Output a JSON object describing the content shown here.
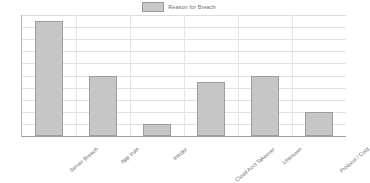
{
  "legend": {
    "entries": [
      {
        "label": "Reason for Breach",
        "swatch_color": "#c6c6c6"
      }
    ],
    "position": "top-center"
  },
  "axes": {
    "y_ticks": [
      "0",
      "2",
      "4",
      "6",
      "8",
      "10",
      "12",
      "14",
      "16",
      "18",
      "20"
    ],
    "x_labels": [
      "Server Breach",
      "App Vuln",
      "Insider",
      "Cloud Acct Takeover",
      "Unknown",
      "Protocol / Cold"
    ]
  },
  "colors": {
    "bar_fill": "#c6c6c6",
    "bar_stroke": "#9d9d9d",
    "grid": "#e2e2e2",
    "axis": "#9e9e9e",
    "text": "#6b6b6b",
    "background": "#ffffff"
  },
  "chart_data": {
    "type": "bar",
    "title": "",
    "subtitle": "",
    "xlabel": "",
    "ylabel": "",
    "categories": [
      "Server Breach",
      "App Vuln",
      "Insider",
      "Cloud Acct Takeover",
      "Unknown",
      "Protocol / Cold"
    ],
    "series": [
      {
        "name": "Reason for Breach",
        "values": [
          19,
          10,
          2,
          9,
          10,
          4
        ],
        "color": "#c6c6c6"
      }
    ],
    "values": [
      19,
      10,
      2,
      9,
      10,
      4
    ],
    "ylim": [
      0,
      20
    ],
    "ytick_step": 2,
    "grid": true,
    "grid_axis": "y",
    "legend_position": "top-center",
    "orientation": "vertical"
  }
}
